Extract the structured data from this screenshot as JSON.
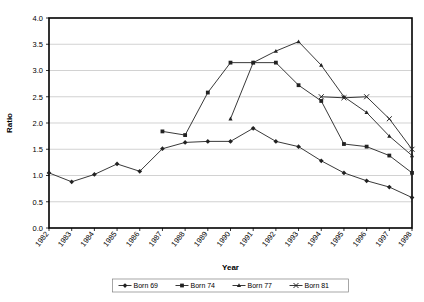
{
  "chart_data": {
    "type": "line",
    "title": "",
    "xlabel": "Year",
    "ylabel": "Ratio",
    "x": [
      1982,
      1983,
      1984,
      1985,
      1986,
      1987,
      1988,
      1989,
      1990,
      1991,
      1992,
      1993,
      1994,
      1995,
      1996,
      1997,
      1998
    ],
    "categories": [
      "1982",
      "1983",
      "1984",
      "1985",
      "1986",
      "1987",
      "1988",
      "1989",
      "1990",
      "1991",
      "1992",
      "1993",
      "1994",
      "1995",
      "1996",
      "1997",
      "1998"
    ],
    "ylim": [
      0,
      4.0
    ],
    "yticks": [
      "0.0",
      "0.5",
      "1.0",
      "1.5",
      "2.0",
      "2.5",
      "3.0",
      "3.5",
      "4.0"
    ],
    "ytick_values": [
      0.0,
      0.5,
      1.0,
      1.5,
      2.0,
      2.5,
      3.0,
      3.5,
      4.0
    ],
    "grid": true,
    "legend_position": "bottom",
    "series": [
      {
        "name": "Born 69",
        "marker": "diamond",
        "color": "#000000",
        "x": [
          1982,
          1983,
          1984,
          1985,
          1986,
          1987,
          1988,
          1989,
          1990,
          1991,
          1992,
          1993,
          1994,
          1995,
          1996,
          1997,
          1998
        ],
        "values": [
          1.05,
          0.88,
          1.02,
          1.22,
          1.08,
          1.51,
          1.63,
          1.65,
          1.65,
          1.9,
          1.65,
          1.55,
          1.28,
          1.05,
          0.9,
          0.78,
          0.58
        ]
      },
      {
        "name": "Born 74",
        "marker": "square",
        "color": "#000000",
        "x": [
          1987,
          1988,
          1989,
          1990,
          1991,
          1992,
          1993,
          1994,
          1995,
          1996,
          1997,
          1998
        ],
        "values": [
          1.84,
          1.77,
          2.58,
          3.15,
          3.15,
          3.15,
          2.72,
          2.42,
          1.6,
          1.55,
          1.38,
          1.05
        ]
      },
      {
        "name": "Born 77",
        "marker": "triangle",
        "color": "#000000",
        "x": [
          1990,
          1991,
          1992,
          1993,
          1994,
          1995,
          1996,
          1997,
          1998
        ],
        "values": [
          2.08,
          3.15,
          3.37,
          3.55,
          3.1,
          2.5,
          2.2,
          1.75,
          1.38
        ]
      },
      {
        "name": "Born 81",
        "marker": "cross",
        "color": "#000000",
        "x": [
          1994,
          1995,
          1996,
          1997,
          1998
        ],
        "values": [
          2.5,
          2.48,
          2.5,
          2.08,
          1.5
        ]
      }
    ]
  },
  "axes": {
    "y_title": "Ratio",
    "x_title": "Year"
  },
  "legend": {
    "items": [
      {
        "label": "Born 69",
        "marker": "diamond"
      },
      {
        "label": "Born 74",
        "marker": "square"
      },
      {
        "label": "Born 77",
        "marker": "triangle"
      },
      {
        "label": "Born 81",
        "marker": "cross"
      }
    ]
  },
  "colors": {
    "line": "#222222",
    "grid": "#bfbfbf",
    "axis": "#000000",
    "background": "#ffffff"
  }
}
